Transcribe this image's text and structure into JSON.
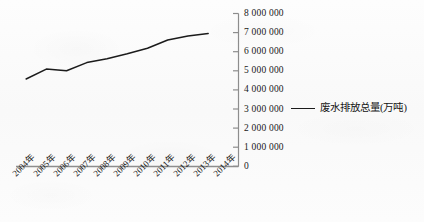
{
  "chart_data": {
    "type": "line",
    "title": "",
    "subtitle": "",
    "xlabel": "",
    "ylabel": "",
    "grid": false,
    "legend_position": "right",
    "categories": [
      "2004年",
      "2005年",
      "2006年",
      "2007年",
      "2008年",
      "2009年",
      "2010年",
      "2011年",
      "2012年",
      "2013年",
      "2014年"
    ],
    "ylim": [
      0,
      8000000
    ],
    "ytick_values": [
      0,
      1000000,
      2000000,
      3000000,
      4000000,
      5000000,
      6000000,
      7000000,
      8000000
    ],
    "ytick_labels": [
      "0",
      "1 000 000",
      "2 000 000",
      "3 000 000",
      "4 000 000",
      "5 000 000",
      "6 000 000",
      "7 000 000",
      "8 000 000"
    ],
    "series": [
      {
        "name": "废水排放总量(万吨)",
        "color": "#1b1b1b",
        "values": [
          4570000,
          5090000,
          5000000,
          5430000,
          5630000,
          5890000,
          6180000,
          6610000,
          6820000,
          6950000,
          null
        ]
      }
    ]
  },
  "legend": {
    "entries": [
      {
        "label": "废水排放总量(万吨)",
        "color": "#1b1b1b"
      }
    ]
  },
  "axes": {
    "y_axis_name": "value-axis",
    "x_axis_name": "category-axis"
  }
}
